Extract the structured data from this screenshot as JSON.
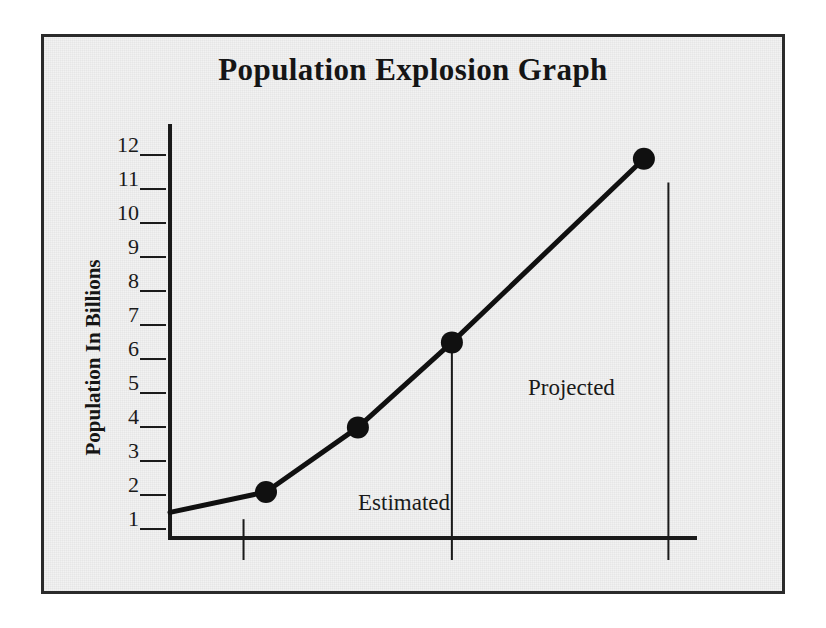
{
  "chart_data": {
    "type": "line",
    "title": "Population Explosion Graph",
    "xlabel": "",
    "ylabel": "Population In Billions",
    "ylim": [
      0,
      12.6
    ],
    "ytick_labels": [
      "12",
      "11",
      "10",
      "9",
      "8",
      "7",
      "6",
      "5",
      "4",
      "3",
      "2",
      "1"
    ],
    "ytick_values": [
      12,
      11,
      10,
      9,
      8,
      7,
      6,
      5,
      4,
      3,
      2,
      1
    ],
    "grid": false,
    "legend": "none",
    "series": [
      {
        "name": "World population",
        "points": [
          {
            "x": 0.0,
            "y": 1.4,
            "marker": false
          },
          {
            "x": 2.35,
            "y": 2.0,
            "marker": true
          },
          {
            "x": 4.6,
            "y": 3.9,
            "marker": true
          },
          {
            "x": 6.9,
            "y": 6.4,
            "marker": true
          },
          {
            "x": 11.6,
            "y": 11.8,
            "marker": true
          }
        ]
      }
    ],
    "annotations": [
      {
        "label": "Estimated",
        "x": 3.2,
        "y": 1.3
      },
      {
        "label": "Projected",
        "x": 7.8,
        "y": 4.6
      }
    ],
    "dividers": [
      {
        "name": "estimated-start-tick",
        "x": 1.8,
        "y_from": 0.0,
        "y_to": 1.2
      },
      {
        "name": "estimated-projected-divider",
        "x": 6.9,
        "y_from": 0.0,
        "y_to": 6.4
      },
      {
        "name": "projected-end-divider",
        "x": 12.2,
        "y_from": 0.0,
        "y_to": 11.1
      }
    ]
  },
  "colors": {
    "ink": "#1a1a1a",
    "frame": "#2b2b2b",
    "paper": "#f2f2f2",
    "line": "#101010"
  }
}
